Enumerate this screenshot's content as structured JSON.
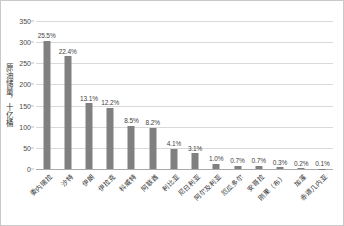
{
  "chart_data": {
    "type": "bar",
    "title": "",
    "xlabel": "",
    "ylabel": "原油储量，十亿桶",
    "ylim": [
      0,
      350
    ],
    "yticks": [
      0,
      50,
      100,
      150,
      200,
      250,
      300,
      350
    ],
    "grid": true,
    "legend": "none",
    "bar_color": "#808080",
    "gridline_color": "#d9d9d9",
    "categories": [
      "委内瑞拉",
      "沙特",
      "伊朗",
      "伊拉克",
      "科威特",
      "阿联酋",
      "利比亚",
      "尼日利亚",
      "阿尔及利亚",
      "厄瓜多尔",
      "安哥拉",
      "刚果（布）",
      "加蓬",
      "赤道几内亚"
    ],
    "values": [
      303,
      267,
      156,
      145,
      102,
      98,
      48,
      37,
      12,
      8,
      8,
      4,
      2,
      1
    ],
    "data_labels": [
      "25.5%",
      "22.4%",
      "13.1%",
      "12.2%",
      "8.5%",
      "8.2%",
      "4.1%",
      "3.1%",
      "1.0%",
      "0.7%",
      "0.7%",
      "0.3%",
      "0.2%",
      "0.1%"
    ]
  }
}
